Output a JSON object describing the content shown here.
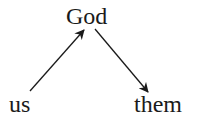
{
  "diagram": {
    "nodes": {
      "top": {
        "label": "God"
      },
      "bottom_left": {
        "label": "us"
      },
      "bottom_right": {
        "label": "them"
      }
    },
    "edges": [
      {
        "from": "us",
        "to": "God",
        "direction": "up-right"
      },
      {
        "from": "God",
        "to": "them",
        "direction": "down-right"
      }
    ],
    "colors": {
      "text": "#1a1a1a",
      "arrow": "#1a1a1a",
      "background": "#ffffff"
    }
  }
}
